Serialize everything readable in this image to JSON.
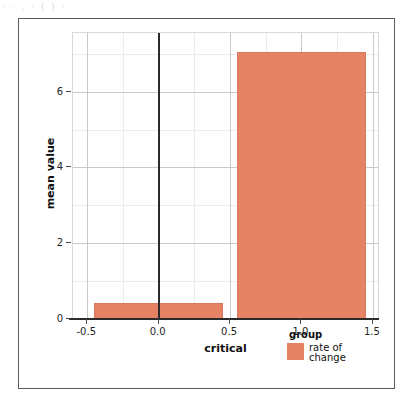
{
  "artifact": {
    "top_text": "· ·  ,  ·  ( ) ·"
  },
  "chart_data": {
    "type": "bar",
    "title": "",
    "subtitle": "",
    "xlabel": "critical",
    "ylabel": "mean value",
    "xlim": [
      -0.6,
      1.55
    ],
    "ylim": [
      0,
      7.55
    ],
    "grid": true,
    "xticks": [
      -0.5,
      0.0,
      0.5,
      1.0,
      1.5
    ],
    "xticklabels": [
      "-0.5",
      "0.0",
      "0.5",
      "1.0",
      "1.5"
    ],
    "yticks": [
      0,
      2,
      4,
      6
    ],
    "yticklabels": [
      "0",
      "2",
      "4",
      "6"
    ],
    "x_minor_ticks": [
      -0.25,
      0.25,
      0.75,
      1.25
    ],
    "y_minor_ticks": [
      1,
      3,
      5,
      7
    ],
    "zero_reference_lines": {
      "x": 0.0,
      "y": 0
    },
    "bar_color": "#e68265",
    "series": [
      {
        "name": "rate of change",
        "color": "#e68265",
        "bars": [
          {
            "category": "0",
            "x_left": -0.45,
            "x_right": 0.45,
            "value": 0.41
          },
          {
            "category": "1",
            "x_left": 0.55,
            "x_right": 1.45,
            "value": 7.06
          }
        ]
      }
    ],
    "legend": {
      "position": "bottom-right",
      "title": "group",
      "entries": [
        {
          "label": "rate of change",
          "color": "#e68265"
        }
      ]
    }
  }
}
